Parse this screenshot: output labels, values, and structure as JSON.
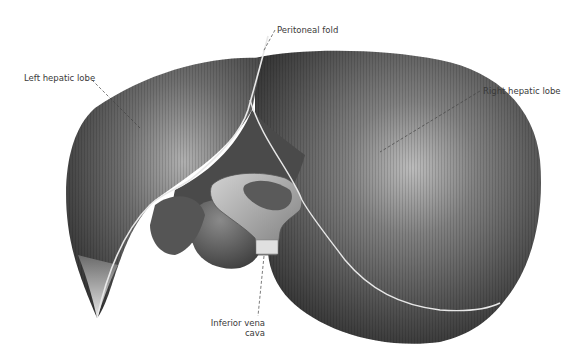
{
  "figure": {
    "labels": {
      "left_hepatic_lobe": "Left hepatic lobe",
      "peritoneal_fold": "Peritoneal fold",
      "right_hepatic_lobe": "Right hepatic lobe",
      "inferior_vena_cava_line1": "Inferior vena",
      "inferior_vena_cava_line2": "cava"
    },
    "colors": {
      "background": "#ffffff",
      "tissue_dark": "#3c3c3c",
      "tissue_mid": "#6a6a6a",
      "tissue_light": "#bdbdbd",
      "label_text": "#3a3a3a",
      "leader_line": "#444444"
    }
  }
}
